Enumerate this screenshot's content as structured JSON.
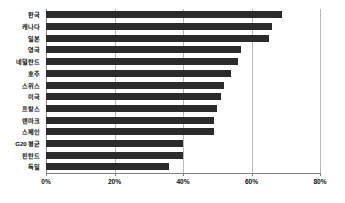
{
  "chart_data": {
    "type": "bar",
    "orientation": "horizontal",
    "title": "",
    "subtitle": "",
    "xlabel": "",
    "ylabel": "",
    "xlim": [
      0,
      80
    ],
    "xticks": [
      0,
      20,
      40,
      60,
      80
    ],
    "xtick_labels": [
      "0%",
      "20%",
      "40%",
      "60%",
      "80%"
    ],
    "grid": true,
    "grid_axis": "x",
    "legend": false,
    "legend_position": "none",
    "bar_color": "#2b2b2b",
    "grid_color": "#b9b9b9",
    "axis_color": "#7d7d7d",
    "categories": [
      "한국",
      "캐나다",
      "일본",
      "영국",
      "네덜란드",
      "호주",
      "스위스",
      "미국",
      "프랑스",
      "덴마크",
      "스페인",
      "G20 평균",
      "핀란드",
      "독일"
    ],
    "values": [
      69,
      66,
      65,
      57,
      56,
      54,
      52,
      51,
      50,
      49,
      49,
      40,
      40,
      36
    ],
    "value_unit": "%"
  }
}
